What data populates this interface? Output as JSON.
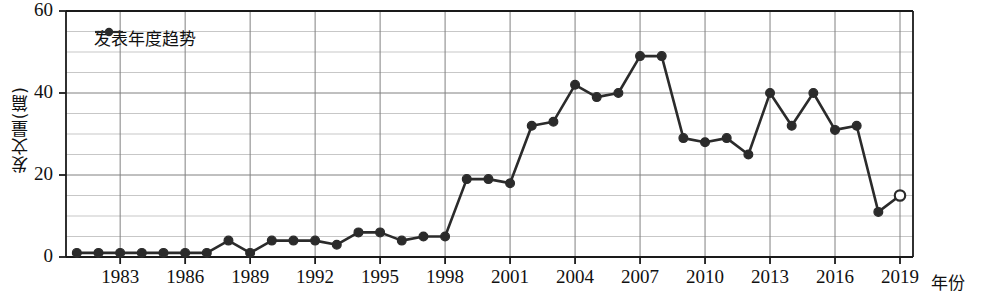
{
  "chart_data": {
    "type": "line",
    "title": "",
    "xlabel": "年份",
    "ylabel": "发文量(篇)",
    "xlim": [
      1980.5,
      2019.6
    ],
    "ylim": [
      0,
      60
    ],
    "y_major_ticks": [
      0,
      20,
      40,
      60
    ],
    "y_minor_step": 5,
    "x_tick_labels": [
      "1983",
      "1986",
      "1989",
      "1992",
      "1995",
      "1998",
      "2001",
      "2004",
      "2007",
      "2010",
      "2013",
      "2016",
      "2019"
    ],
    "x_tick_values": [
      1983,
      1986,
      1989,
      1992,
      1995,
      1998,
      2001,
      2004,
      2007,
      2010,
      2013,
      2016,
      2019
    ],
    "grid": true,
    "legend_position": "top-left",
    "legend": [
      "发表年度趋势"
    ],
    "series": [
      {
        "name": "发表年度趋势",
        "marker": "filled-circle",
        "color": "#2b2b2b",
        "x": [
          1981,
          1982,
          1983,
          1984,
          1985,
          1986,
          1987,
          1988,
          1989,
          1990,
          1991,
          1992,
          1993,
          1994,
          1995,
          1996,
          1997,
          1998,
          1999,
          2000,
          2001,
          2002,
          2003,
          2004,
          2005,
          2006,
          2007,
          2008,
          2009,
          2010,
          2011,
          2012,
          2013,
          2014,
          2015,
          2016,
          2017,
          2018,
          2019
        ],
        "values": [
          1,
          1,
          1,
          1,
          1,
          1,
          1,
          4,
          1,
          4,
          4,
          4,
          3,
          6,
          6,
          4,
          5,
          5,
          19,
          19,
          18,
          32,
          33,
          42,
          39,
          40,
          49,
          49,
          29,
          28,
          29,
          25,
          40,
          32,
          40,
          31,
          32,
          11,
          15
        ],
        "open_marker_points": [
          2019
        ]
      }
    ],
    "ylabel_display": "发文量(篇)"
  },
  "axis": {
    "y_labels": [
      "60",
      "40",
      "20",
      "0"
    ],
    "x_axis_title": "年份",
    "y_axis_title": "发文量(篇)"
  },
  "legend": {
    "entries": [
      {
        "label": "发表年度趋势",
        "marker": "filled-circle-with-line"
      }
    ]
  }
}
